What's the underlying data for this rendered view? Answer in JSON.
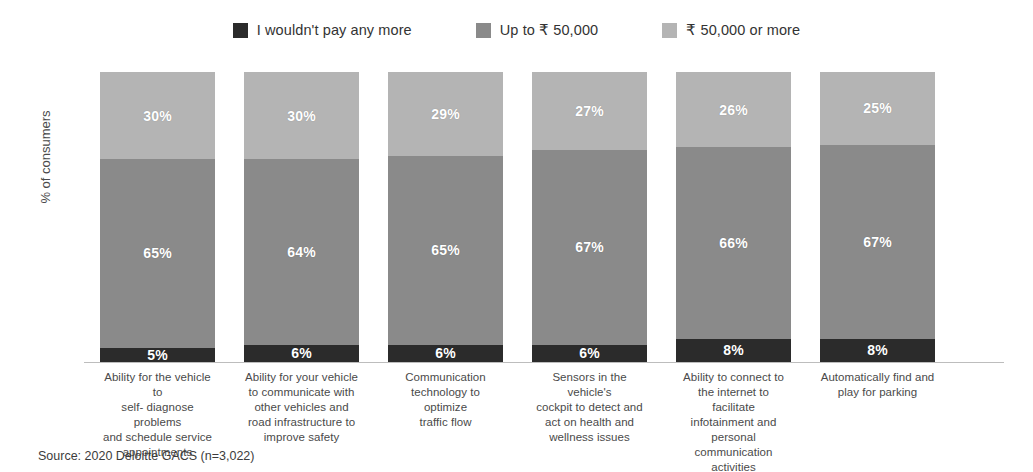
{
  "chart_data": {
    "type": "bar",
    "subtype": "stacked-bar-100",
    "title": "",
    "xlabel": "",
    "ylabel": "% of consumers",
    "ylim": [
      0,
      100
    ],
    "grid": false,
    "legend_position": "top-center",
    "stack_order_bottom_to_top": [
      "I wouldn't pay any more",
      "Up to ₹ 50,000",
      "₹ 50,000 or more"
    ],
    "categories": [
      "Ability for the vehicle to self- diagnose problems and schedule service appointments",
      "Ability for your vehicle to communicate with other vehicles and road infrastructure to improve safety",
      "Communication technology to optimize traffic flow",
      "Sensors in the vehicle's cockpit to detect and act on health and wellness issues",
      "Ability to connect to the internet to facilitate infotainment and personal communication activities",
      "Automatically find and play for parking"
    ],
    "series": [
      {
        "name": "I wouldn't pay any more",
        "color": "#2b2b2b",
        "values": [
          5,
          6,
          6,
          6,
          8,
          8
        ]
      },
      {
        "name": "Up to ₹ 50,000",
        "color": "#8a8a8a",
        "values": [
          65,
          64,
          65,
          67,
          66,
          67
        ]
      },
      {
        "name": "₹ 50,000 or more",
        "color": "#b4b4b4",
        "values": [
          30,
          30,
          29,
          27,
          26,
          25
        ]
      }
    ],
    "value_labels": [
      {
        "top": "30%",
        "middle": "65%",
        "bottom": "5%"
      },
      {
        "top": "30%",
        "middle": "64%",
        "bottom": "6%"
      },
      {
        "top": "29%",
        "middle": "65%",
        "bottom": "6%"
      },
      {
        "top": "27%",
        "middle": "67%",
        "bottom": "6%"
      },
      {
        "top": "26%",
        "middle": "66%",
        "bottom": "8%"
      },
      {
        "top": "25%",
        "middle": "67%",
        "bottom": "8%"
      }
    ],
    "source": "Source: 2020 Deloitte GACS (n=3,022)"
  },
  "legend": {
    "items": [
      {
        "label": "I wouldn't pay any more",
        "color": "#2b2b2b"
      },
      {
        "label": "Up to ₹ 50,000",
        "color": "#8a8a8a"
      },
      {
        "label": "₹ 50,000 or more",
        "color": "#b4b4b4"
      }
    ]
  },
  "axis": {
    "y_title": "% of consumers"
  },
  "category_labels": {
    "c0": [
      "Ability for the vehicle to",
      "self- diagnose problems",
      "and schedule service",
      "appointments"
    ],
    "c1": [
      "Ability for your vehicle",
      "to communicate with",
      "other vehicles and",
      "road infrastructure to",
      "improve safety"
    ],
    "c2": [
      "Communication",
      "technology to optimize",
      "traffic flow"
    ],
    "c3": [
      "Sensors in the vehicle's",
      "cockpit to detect and",
      "act on health and",
      "wellness issues"
    ],
    "c4": [
      "Ability to connect to",
      "the internet to facilitate",
      "infotainment and",
      "personal communication",
      "activities"
    ],
    "c5": [
      "Automatically find and",
      "play for parking"
    ]
  },
  "footer": {
    "source": "Source: 2020 Deloitte GACS (n=3,022)"
  }
}
